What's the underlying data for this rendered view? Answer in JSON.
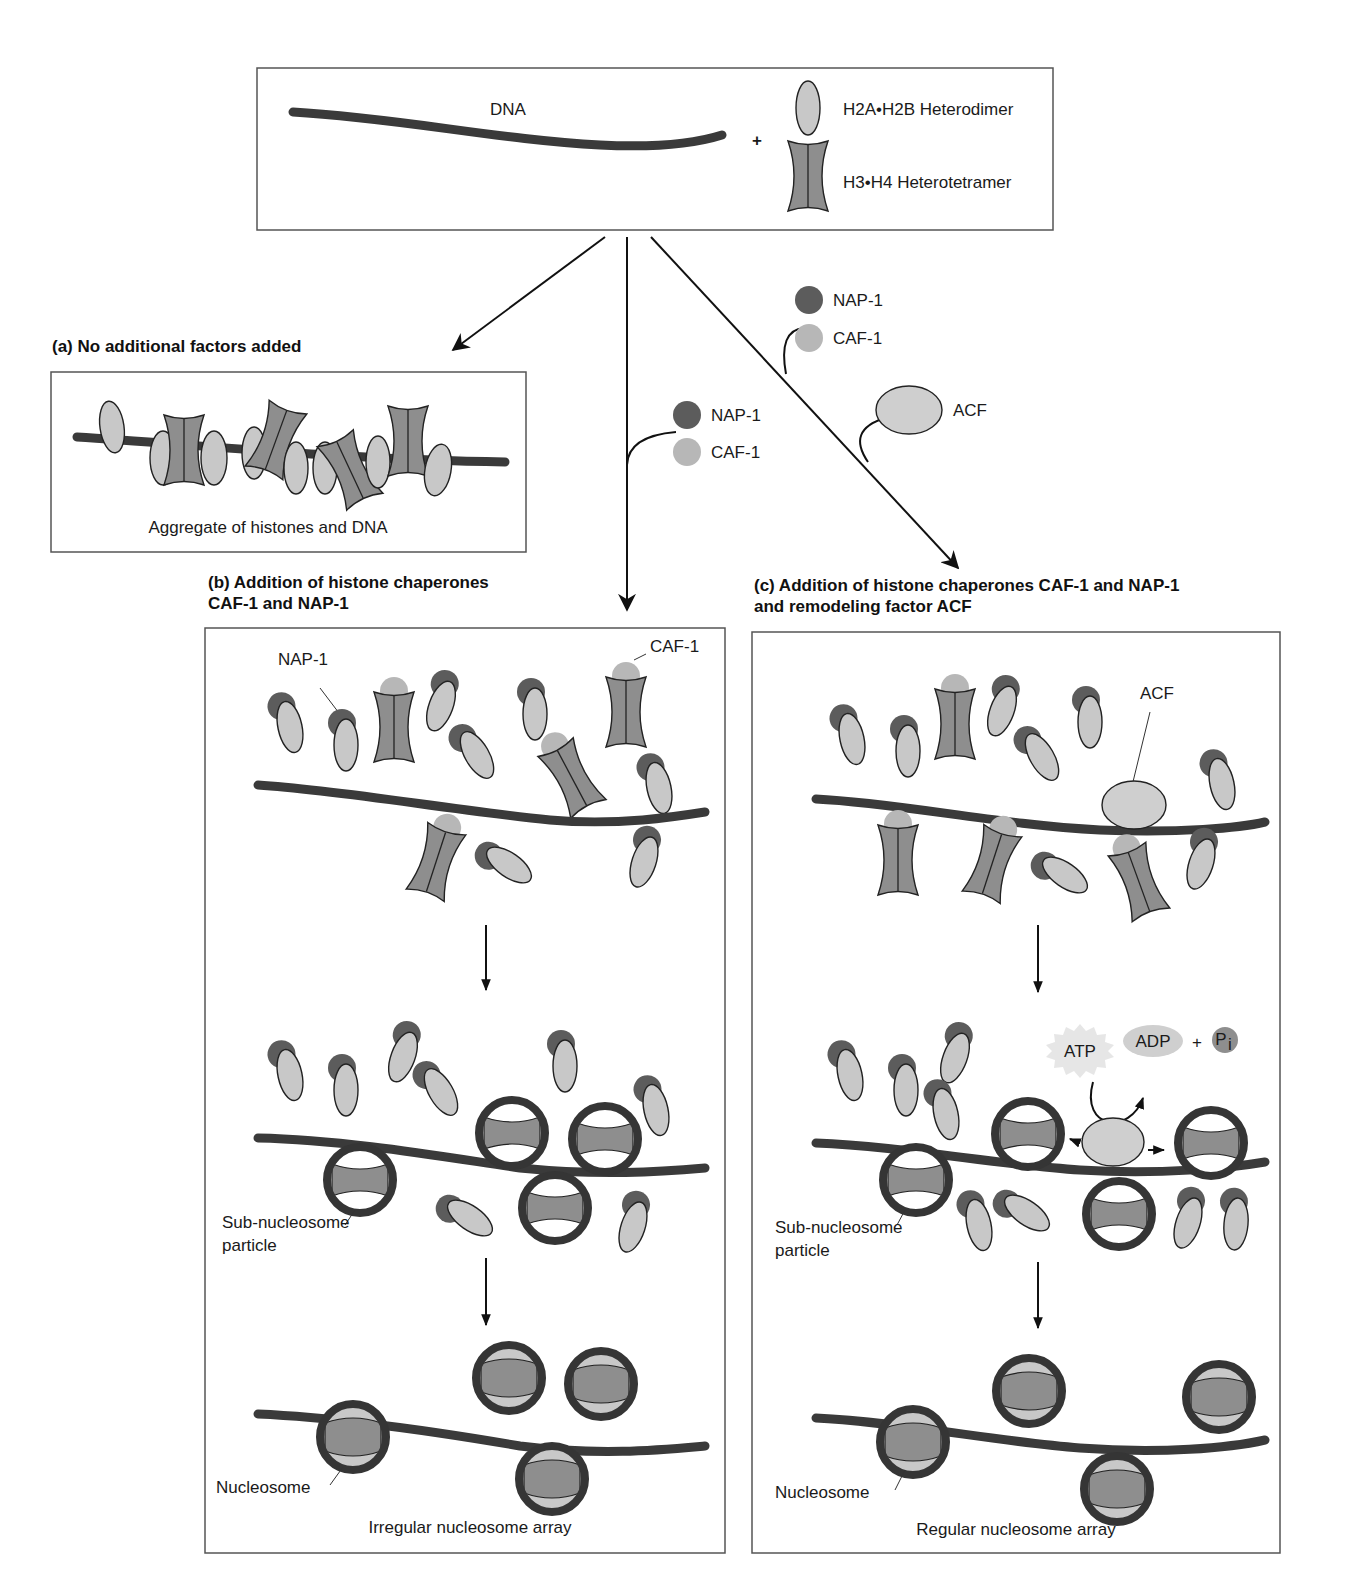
{
  "figure": {
    "colors": {
      "dna": "#3a3a3a",
      "h2a_h2b": "#c8c8c8",
      "h3_h4": "#8e8e8e",
      "nap1": "#5c5c5c",
      "caf1": "#b7b7b7",
      "acf": "#cfcfcf",
      "nucleosome_ring": "#353535"
    },
    "legend": {
      "dna_label": "DNA",
      "plus": "+",
      "h2a_h2b_label": "H2A•H2B Heterodimer",
      "h3_h4_label": "H3•H4 Heterotetramer"
    },
    "branch_b_factors": {
      "nap1": "NAP-1",
      "caf1": "CAF-1"
    },
    "branch_c_factors": {
      "nap1": "NAP-1",
      "caf1": "CAF-1",
      "acf": "ACF"
    },
    "panel_a": {
      "title": "(a) No additional factors added",
      "caption": "Aggregate of histones and DNA"
    },
    "panel_b": {
      "title_line1": "(b)  Addition of histone chaperones",
      "title_line2": "CAF-1 and NAP-1",
      "label_nap1": "NAP-1",
      "label_caf1": "CAF-1",
      "label_subnucleosome_line1": "Sub-nucleosome",
      "label_subnucleosome_line2": "particle",
      "label_nucleosome": "Nucleosome",
      "caption": "Irregular nucleosome array"
    },
    "panel_c": {
      "title_line1": "(c)  Addition of histone chaperones CAF-1 and NAP-1",
      "title_line2": "and remodeling factor ACF",
      "label_acf": "ACF",
      "atp": "ATP",
      "adp": "ADP",
      "plus": "+",
      "pi": "P",
      "pi_sub": "i",
      "label_subnucleosome_line1": "Sub-nucleosome",
      "label_subnucleosome_line2": "particle",
      "label_nucleosome": "Nucleosome",
      "caption": "Regular nucleosome array"
    }
  }
}
